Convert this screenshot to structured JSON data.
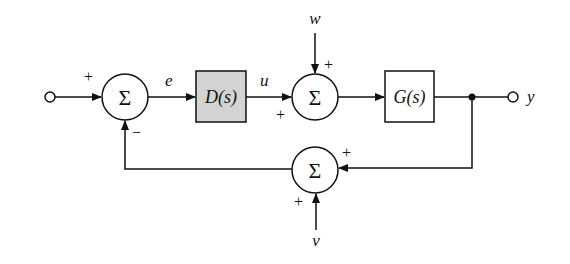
{
  "diagram": {
    "type": "block-diagram",
    "colors": {
      "line": "#111111",
      "controller_fill": "#d3d3d3",
      "background": "#ffffff"
    },
    "signals": {
      "error": "e",
      "control": "u",
      "disturbance": "w",
      "output": "y",
      "noise": "v"
    },
    "blocks": {
      "controller": "D(s)",
      "plant": "G(s)"
    },
    "summing_junctions": {
      "symbol": "Σ",
      "sum1": {
        "top_sign": "+",
        "bottom_sign": "−"
      },
      "sum2": {
        "top_sign": "+",
        "left_sign": "+"
      },
      "sum3": {
        "right_sign": "+",
        "bottom_sign": "+"
      }
    }
  }
}
